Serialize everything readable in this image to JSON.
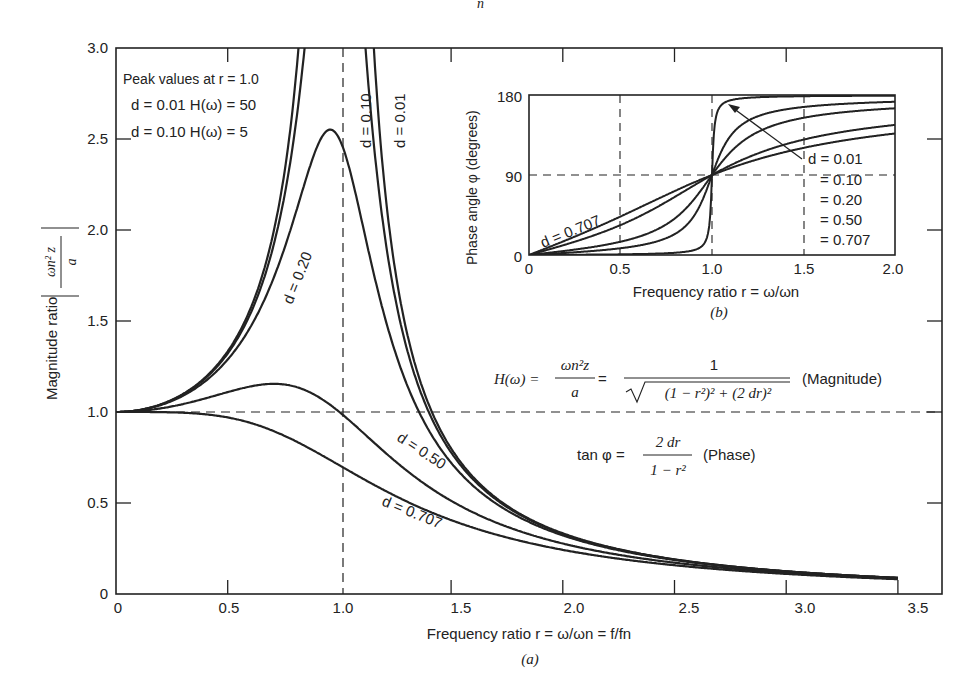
{
  "chart_data": [
    {
      "id": "a",
      "type": "line",
      "caption": "(a)",
      "title": "",
      "xlabel": "Frequency ratio r = ω/ωn = f/fn",
      "ylabel": "Magnitude ratio |ωn² z / a|",
      "xlim": [
        0,
        3.5
      ],
      "ylim": [
        0,
        3.0
      ],
      "xticks": [
        "0",
        "0.5",
        "1.0",
        "1.5",
        "2.0",
        "2.5",
        "3.0",
        "3.5"
      ],
      "yticks": [
        "0",
        "0.5",
        "1.0",
        "1.5",
        "2.0",
        "2.5",
        "3.0"
      ],
      "grid": false,
      "reference_lines": [
        {
          "orientation": "vertical",
          "x": 1.0,
          "style": "dashed"
        },
        {
          "orientation": "horizontal",
          "y": 1.0,
          "style": "dashed"
        }
      ],
      "formula": "H(r) = 1 / sqrt((1 - r^2)^2 + (2 d r)^2)",
      "x": [
        0,
        0.25,
        0.5,
        0.75,
        1.0,
        1.25,
        1.5,
        2.0,
        2.5,
        3.0,
        3.5
      ],
      "series": [
        {
          "name": "d = 0.01",
          "label": "d = 0.01",
          "values": [
            1.0,
            1.067,
            1.333,
            2.286,
            50.0,
            1.778,
            0.8,
            0.333,
            0.19,
            0.125,
            0.089
          ]
        },
        {
          "name": "d = 0.10",
          "label": "d = 0.10",
          "values": [
            1.0,
            1.065,
            1.322,
            2.218,
            5.0,
            1.7,
            0.789,
            0.331,
            0.19,
            0.125,
            0.088
          ]
        },
        {
          "name": "d = 0.20",
          "label": "d = 0.20",
          "values": [
            1.0,
            1.06,
            1.29,
            2.04,
            2.5,
            1.52,
            0.76,
            0.327,
            0.189,
            0.124,
            0.088
          ]
        },
        {
          "name": "d = 0.50",
          "label": "d = 0.50",
          "values": [
            1.0,
            1.031,
            1.109,
            1.152,
            1.0,
            0.82,
            0.555,
            0.277,
            0.165,
            0.113,
            0.082
          ]
        },
        {
          "name": "d = 0.707",
          "label": "d = 0.707",
          "values": [
            1.0,
            0.998,
            0.97,
            0.873,
            0.707,
            0.538,
            0.406,
            0.243,
            0.158,
            0.11,
            0.081
          ]
        }
      ],
      "annotations": [
        "Peak values at r = 1.0",
        "d = 0.01  H(ω) = 50",
        "d = 0.10  H(ω) = 5",
        "H(ω) = ωn²z / a = 1 / √((1 − r²)² + (2 dr)²)  (Magnitude)",
        "tan φ = 2 dr / (1 − r²)  (Phase)"
      ],
      "peak_values": [
        {
          "d": "0.01",
          "H": "50"
        },
        {
          "d": "0.10",
          "H": "5"
        }
      ]
    },
    {
      "id": "b",
      "type": "line",
      "caption": "(b)",
      "title": "",
      "xlabel": "Frequency ratio r = ω/ωn",
      "ylabel": "Phase angle φ (degrees)",
      "xlim": [
        0,
        2.0
      ],
      "ylim": [
        0,
        180
      ],
      "xticks": [
        "0",
        "0.5",
        "1.0",
        "1.5",
        "2.0"
      ],
      "yticks": [
        "0",
        "90",
        "180"
      ],
      "grid": true,
      "grid_style": "dashed",
      "formula": "tan φ = 2 d r / (1 - r^2)",
      "x": [
        0,
        0.25,
        0.5,
        0.75,
        1.0,
        1.25,
        1.5,
        2.0
      ],
      "series": [
        {
          "name": "d = 0.01",
          "values": [
            0,
            0.3,
            0.8,
            2.0,
            90,
            177.5,
            178.6,
            179.2
          ]
        },
        {
          "name": "d = 0.10",
          "values": [
            0,
            3.1,
            7.6,
            18.9,
            90,
            155.8,
            166.9,
            172.4
          ]
        },
        {
          "name": "d = 0.20",
          "values": [
            0,
            6.1,
            14.9,
            34.4,
            90,
            138.0,
            154.4,
            165.1
          ]
        },
        {
          "name": "d = 0.50",
          "values": [
            0,
            14.9,
            33.7,
            59.7,
            90,
            114.0,
            129.8,
            146.3
          ]
        },
        {
          "name": "d = 0.707",
          "values": [
            0,
            20.7,
            43.3,
            71.7,
            90,
            106.4,
            121.7,
            136.7
          ]
        }
      ],
      "legend": {
        "position": "inside-right",
        "entries": [
          "d = 0.01",
          "= 0.10",
          "= 0.20",
          "= 0.50",
          "= 0.707"
        ]
      },
      "annotations": [
        "d = 0.707"
      ]
    }
  ],
  "labels": {
    "top_fragment": "n",
    "main": {
      "y_axis_title": "Magnitude ratio",
      "y_axis_fraction_num": "ωn² z",
      "y_axis_fraction_den": "a",
      "x_axis_title": "Frequency ratio r = ω/ωn = f/fn",
      "caption": "(a)",
      "yticks": [
        "0",
        "0.5",
        "1.0",
        "1.5",
        "2.0",
        "2.5",
        "3.0"
      ],
      "xticks": [
        "0",
        "0.5",
        "1.0",
        "1.5",
        "2.0",
        "2.5",
        "3.0",
        "3.5"
      ],
      "peak_title": "Peak values at r = 1.0",
      "peak_line1": "d = 0.01  H(ω) = 50",
      "peak_line2": "d = 0.10  H(ω) = 5",
      "curve_labels": [
        "d = 0.01",
        "d = 0.10",
        "d = 0.20",
        "d = 0.50",
        "d = 0.707"
      ],
      "magnitude_formula_lhs": "H(ω) =",
      "magnitude_formula_frac1_num": "ωn²z",
      "magnitude_formula_frac1_den": "a",
      "magnitude_formula_frac2_num": "1",
      "magnitude_formula_frac2_den": "(1 − r²)² + (2 dr)²",
      "magnitude_tag": "(Magnitude)",
      "phase_formula_lhs": "tan φ =",
      "phase_formula_num": "2 dr",
      "phase_formula_den": "1 − r²",
      "phase_tag": "(Phase)"
    },
    "inset": {
      "y_axis_title": "Phase angle φ (degrees)",
      "x_axis_title": "Frequency ratio r = ω/ωn",
      "caption": "(b)",
      "yticks": [
        "0",
        "90",
        "180"
      ],
      "xticks": [
        "0",
        "0.5",
        "1.0",
        "1.5",
        "2.0"
      ],
      "legend": [
        "d = 0.01",
        "= 0.10",
        "= 0.20",
        "= 0.50",
        "= 0.707"
      ],
      "curve_label": "d = 0.707"
    }
  },
  "damping_ratios": [
    0.01,
    0.1,
    0.2,
    0.5,
    0.707
  ],
  "colors": {
    "ink": "#222222",
    "background": "#ffffff"
  }
}
